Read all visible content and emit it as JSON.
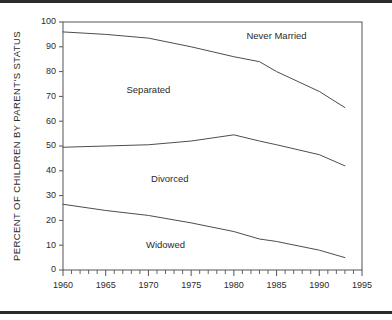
{
  "chart_data": {
    "type": "line",
    "title": "",
    "subtitle": "",
    "xlabel": "",
    "ylabel": "PERCENT OF CHILDREN BY PARENT'S STATUS",
    "xlim": [
      1960,
      1995
    ],
    "ylim": [
      0,
      100
    ],
    "grid": false,
    "legend_position": "inline-annotations",
    "x_ticks": [
      1960,
      1965,
      1970,
      1975,
      1980,
      1985,
      1990,
      1995
    ],
    "x_tick_labels": [
      "1960",
      "1965",
      "1970",
      "1975",
      "1980",
      "1985",
      "1990",
      "1995"
    ],
    "x_minor_tick_step": 1,
    "y_ticks": [
      0,
      10,
      20,
      30,
      40,
      50,
      60,
      70,
      80,
      90,
      100
    ],
    "y_tick_labels": [
      "0",
      "10",
      "20",
      "30",
      "40",
      "50",
      "60",
      "70",
      "80",
      "90",
      "100"
    ],
    "x": [
      1960,
      1965,
      1970,
      1975,
      1980,
      1983,
      1985,
      1990,
      1993
    ],
    "series": [
      {
        "name": "Never Married",
        "label": "Never Married",
        "label_x": 1985,
        "label_y": 93,
        "values": [
          96,
          95,
          93.5,
          90,
          86,
          84,
          80,
          72,
          65.5
        ],
        "color": "#4d4d4d"
      },
      {
        "name": "Divorced",
        "label": "Divorced",
        "label_x": 1972.5,
        "label_y": 35.5,
        "values": [
          49.5,
          50,
          50.5,
          52,
          54.5,
          52,
          50.5,
          46.5,
          42
        ],
        "color": "#4d4d4d"
      },
      {
        "name": "Widowed",
        "label": "Widowed",
        "label_x": 1972,
        "label_y": 9,
        "values": [
          26.5,
          24,
          22,
          19,
          15.5,
          12.5,
          11.5,
          8,
          5
        ],
        "color": "#4d4d4d"
      }
    ],
    "annotations": [
      {
        "text": "Separated",
        "x": 1970,
        "y": 71.5
      },
      {
        "text": "Never Married",
        "x": 1985,
        "y": 93
      },
      {
        "text": "Divorced",
        "x": 1972.5,
        "y": 35.5
      },
      {
        "text": "Widowed",
        "x": 1972,
        "y": 9
      }
    ],
    "colors": {
      "line": "#4d4d4d",
      "frame": "#555555",
      "text": "#2b2b2b",
      "rule": "#2b2b2b",
      "background": "#ffffff"
    }
  }
}
